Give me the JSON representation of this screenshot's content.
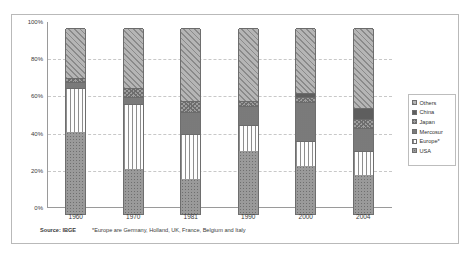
{
  "chart_data": {
    "type": "bar",
    "stacked": true,
    "stack_mode": "percent",
    "title": "",
    "xlabel": "",
    "ylabel": "",
    "ylim": [
      0,
      100
    ],
    "ytick_labels": [
      "0%",
      "20%",
      "40%",
      "60%",
      "80%",
      "100%"
    ],
    "ytick_values": [
      0,
      20,
      40,
      60,
      80,
      100
    ],
    "grid": true,
    "grid_style": "dashed-horizontal",
    "legend_position": "right",
    "categories": [
      "1960",
      "1970",
      "1981",
      "1990",
      "2000",
      "2004"
    ],
    "series": [
      {
        "name": "USA",
        "pattern": "dotted-fill",
        "values": [
          44,
          24,
          19,
          34,
          26,
          21
        ]
      },
      {
        "name": "Europe*",
        "pattern": "vertical-lines",
        "values": [
          24,
          35,
          24,
          14,
          13,
          13
        ]
      },
      {
        "name": "Mercosur",
        "pattern": "fine-dots",
        "values": [
          3,
          4,
          12,
          10,
          21,
          12
        ]
      },
      {
        "name": "Japan",
        "pattern": "cross-hatch",
        "values": [
          2,
          5,
          6,
          3,
          3,
          5
        ]
      },
      {
        "name": "China",
        "pattern": "solid-dark",
        "values": [
          0,
          0,
          0,
          0,
          2,
          6
        ]
      },
      {
        "name": "Others",
        "pattern": "diagonal-lines",
        "values": [
          27,
          32,
          39,
          39,
          35,
          43
        ]
      }
    ],
    "annotations": {
      "source": "Source: IBGE",
      "footnote": "*Europe are Germany, Holland, UK, France, Belgium and Italy"
    }
  },
  "legend": {
    "items": [
      {
        "label": "Others"
      },
      {
        "label": "China"
      },
      {
        "label": "Japan"
      },
      {
        "label": "Mercosur"
      },
      {
        "label": "Europe*"
      },
      {
        "label": "USA"
      }
    ]
  },
  "footer": {
    "source": "Source: IBGE",
    "note": "*Europe are Germany, Holland, UK, France, Belgium and Italy"
  }
}
